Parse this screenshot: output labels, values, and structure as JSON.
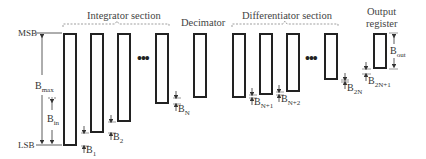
{
  "diagram": {
    "sections": {
      "integrator": "Integrator section",
      "decimator": "Decimator",
      "differentiator": "Differentiator section",
      "output_line1": "Output",
      "output_line2": "register"
    },
    "axis": {
      "msb": "MSB",
      "lsb": "LSB",
      "bmax_main": "B",
      "bmax_sub": "max",
      "bin_main": "B",
      "bin_sub": "in"
    },
    "prune_labels": [
      {
        "main": "B",
        "sub": "1"
      },
      {
        "main": "B",
        "sub": "2"
      },
      {
        "main": "B",
        "sub": "N"
      },
      {
        "main": "B",
        "sub": "N+1"
      },
      {
        "main": "B",
        "sub": "N+2"
      },
      {
        "main": "B",
        "sub": "2N"
      },
      {
        "main": "B",
        "sub": "2N+1"
      }
    ],
    "output_width": {
      "main": "B",
      "sub": "out"
    },
    "ellipsis": "•••",
    "registers": [
      {
        "stage": "integrator-1",
        "x": 63,
        "top": 33,
        "bottom": 146
      },
      {
        "stage": "integrator-2",
        "x": 90,
        "top": 33,
        "bottom": 133
      },
      {
        "stage": "integrator-3",
        "x": 117,
        "top": 33,
        "bottom": 122
      },
      {
        "stage": "integrator-N",
        "x": 155,
        "top": 33,
        "bottom": 104
      },
      {
        "stage": "decimator",
        "x": 193,
        "top": 33,
        "bottom": 98
      },
      {
        "stage": "differentiator-1",
        "x": 232,
        "top": 33,
        "bottom": 98
      },
      {
        "stage": "differentiator-2",
        "x": 259,
        "top": 33,
        "bottom": 95
      },
      {
        "stage": "differentiator-3",
        "x": 286,
        "top": 33,
        "bottom": 92
      },
      {
        "stage": "differentiator-N",
        "x": 324,
        "top": 33,
        "bottom": 80
      },
      {
        "stage": "output",
        "x": 373,
        "top": 33,
        "bottom": 69
      }
    ]
  }
}
